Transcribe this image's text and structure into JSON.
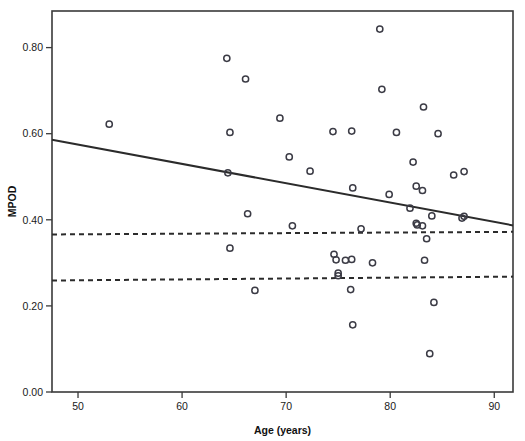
{
  "chart_data": {
    "type": "scatter",
    "title": "",
    "xlabel": "Age (years)",
    "ylabel": "MPOD",
    "xlim": [
      47.5,
      91.8
    ],
    "ylim": [
      0.0,
      0.885
    ],
    "xticks": [
      50,
      60,
      70,
      80,
      90
    ],
    "xtick_labels": [
      "50",
      "60",
      "70",
      "80",
      "90"
    ],
    "yticks": [
      0.0,
      0.2,
      0.4,
      0.6,
      0.8
    ],
    "ytick_labels": [
      "0.00",
      "0.20",
      "0.40",
      "0.60",
      "0.80"
    ],
    "grid": false,
    "legend": null,
    "marker": "open-circle",
    "point_count": 53,
    "points": [
      {
        "x": 53.0,
        "y": 0.622
      },
      {
        "x": 64.3,
        "y": 0.775
      },
      {
        "x": 66.1,
        "y": 0.727
      },
      {
        "x": 64.6,
        "y": 0.603
      },
      {
        "x": 64.4,
        "y": 0.509
      },
      {
        "x": 66.3,
        "y": 0.414
      },
      {
        "x": 64.6,
        "y": 0.334
      },
      {
        "x": 67.0,
        "y": 0.236
      },
      {
        "x": 69.4,
        "y": 0.636
      },
      {
        "x": 70.3,
        "y": 0.546
      },
      {
        "x": 72.3,
        "y": 0.513
      },
      {
        "x": 70.6,
        "y": 0.386
      },
      {
        "x": 74.5,
        "y": 0.605
      },
      {
        "x": 76.3,
        "y": 0.606
      },
      {
        "x": 79.0,
        "y": 0.843
      },
      {
        "x": 79.2,
        "y": 0.703
      },
      {
        "x": 80.6,
        "y": 0.603
      },
      {
        "x": 83.2,
        "y": 0.662
      },
      {
        "x": 84.6,
        "y": 0.6
      },
      {
        "x": 82.2,
        "y": 0.534
      },
      {
        "x": 86.1,
        "y": 0.504
      },
      {
        "x": 87.1,
        "y": 0.512
      },
      {
        "x": 76.4,
        "y": 0.474
      },
      {
        "x": 79.9,
        "y": 0.459
      },
      {
        "x": 82.5,
        "y": 0.478
      },
      {
        "x": 83.1,
        "y": 0.468
      },
      {
        "x": 81.9,
        "y": 0.427
      },
      {
        "x": 84.0,
        "y": 0.409
      },
      {
        "x": 86.9,
        "y": 0.404
      },
      {
        "x": 87.1,
        "y": 0.408
      },
      {
        "x": 77.2,
        "y": 0.379
      },
      {
        "x": 82.5,
        "y": 0.392
      },
      {
        "x": 82.6,
        "y": 0.388
      },
      {
        "x": 83.1,
        "y": 0.386
      },
      {
        "x": 83.5,
        "y": 0.356
      },
      {
        "x": 74.6,
        "y": 0.32
      },
      {
        "x": 74.8,
        "y": 0.307
      },
      {
        "x": 75.7,
        "y": 0.306
      },
      {
        "x": 76.3,
        "y": 0.308
      },
      {
        "x": 78.3,
        "y": 0.3
      },
      {
        "x": 83.3,
        "y": 0.306
      },
      {
        "x": 75.0,
        "y": 0.276
      },
      {
        "x": 75.0,
        "y": 0.27
      },
      {
        "x": 76.2,
        "y": 0.238
      },
      {
        "x": 84.2,
        "y": 0.208
      },
      {
        "x": 76.4,
        "y": 0.156
      },
      {
        "x": 83.8,
        "y": 0.089
      }
    ],
    "lines": [
      {
        "name": "regression-line",
        "style": "solid",
        "x0": 47.5,
        "y0": 0.586,
        "x1": 91.8,
        "y1": 0.387
      },
      {
        "name": "upper-reference-line",
        "style": "dashed",
        "x0": 47.5,
        "y0": 0.366,
        "x1": 91.8,
        "y1": 0.372
      },
      {
        "name": "lower-reference-line",
        "style": "dashed",
        "x0": 47.5,
        "y0": 0.259,
        "x1": 91.8,
        "y1": 0.268
      }
    ]
  },
  "axes": {
    "x_title": "Age (years)",
    "y_title": "MPOD"
  }
}
